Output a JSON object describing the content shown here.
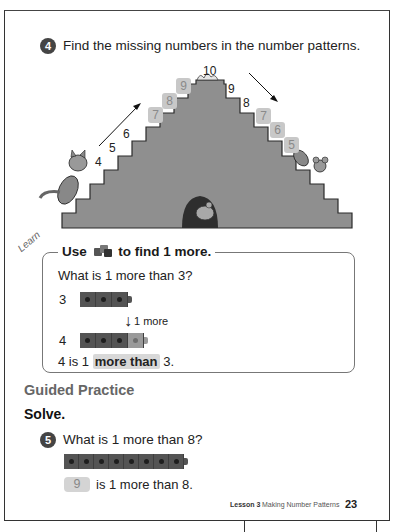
{
  "question4": {
    "number": "4",
    "text": "Find the missing numbers in the number patterns."
  },
  "staircase": {
    "top_label": "10",
    "left_given": [
      "4",
      "5",
      "6"
    ],
    "left_answers": [
      "7",
      "8",
      "9"
    ],
    "right_given": [
      "9",
      "8"
    ],
    "right_answers": [
      "7",
      "6",
      "5"
    ],
    "colors": {
      "steps": "#8f8f8f",
      "step_edge": "#2a2a2a",
      "answer_box": "#c8c8c8"
    }
  },
  "learn": {
    "tag": "Learn",
    "heading_prefix": "Use",
    "heading_suffix": "to find 1 more.",
    "question": "What is 1 more than 3?",
    "row1_label": "3",
    "arrow_label": "1 more",
    "row2_label": "4",
    "conclusion_prefix": "4 is 1",
    "conclusion_highlight": "more than",
    "conclusion_suffix": "3."
  },
  "guided": {
    "title": "Guided Practice",
    "instruction": "Solve."
  },
  "question5": {
    "number": "5",
    "text": "What is 1 more than 8?",
    "cube_count": 8,
    "answer": "9",
    "answer_suffix": "is 1 more than 8."
  },
  "footer": {
    "lesson": "Lesson 3",
    "title": "Making Number Patterns",
    "page": "23"
  }
}
